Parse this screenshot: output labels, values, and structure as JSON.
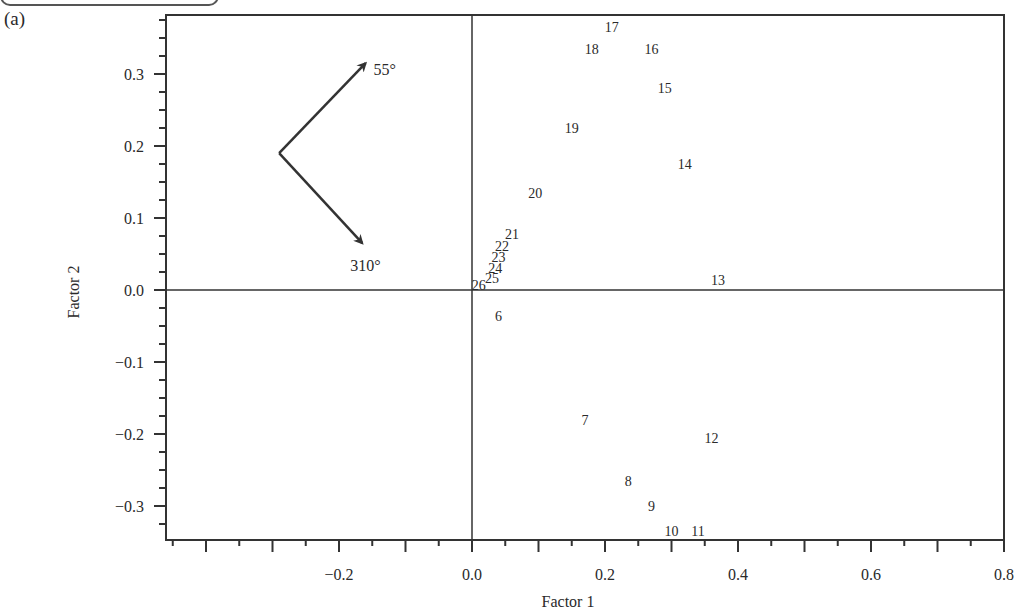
{
  "figure": {
    "panel_label": "(a)"
  },
  "chart_data": {
    "type": "scatter",
    "title": "",
    "panel_label": "(a)",
    "xlabel": "Factor 1",
    "ylabel": "Factor 2",
    "xlim": [
      -0.46,
      0.8
    ],
    "ylim": [
      -0.345,
      0.38
    ],
    "x_ticks": [
      -0.2,
      0.0,
      0.2,
      0.4,
      0.6,
      0.8
    ],
    "x_tick_labels": [
      "−0.2",
      "0.0",
      "0.2",
      "0.4",
      "0.6",
      "0.8"
    ],
    "y_ticks": [
      -0.3,
      -0.2,
      -0.1,
      0.0,
      0.1,
      0.2,
      0.3
    ],
    "y_tick_labels": [
      "−0.3",
      "−0.2",
      "−0.1",
      "0.0",
      "0.1",
      "0.2",
      "0.3"
    ],
    "grid": false,
    "zero_lines": true,
    "marker": "text-label",
    "points": [
      {
        "label": "6",
        "x": 0.04,
        "y": -0.036
      },
      {
        "label": "7",
        "x": 0.17,
        "y": -0.18
      },
      {
        "label": "8",
        "x": 0.235,
        "y": -0.265
      },
      {
        "label": "9",
        "x": 0.27,
        "y": -0.3
      },
      {
        "label": "10",
        "x": 0.3,
        "y": -0.335
      },
      {
        "label": "11",
        "x": 0.34,
        "y": -0.335
      },
      {
        "label": "12",
        "x": 0.36,
        "y": -0.205
      },
      {
        "label": "13",
        "x": 0.37,
        "y": 0.014
      },
      {
        "label": "14",
        "x": 0.32,
        "y": 0.175
      },
      {
        "label": "15",
        "x": 0.29,
        "y": 0.28
      },
      {
        "label": "16",
        "x": 0.27,
        "y": 0.335
      },
      {
        "label": "17",
        "x": 0.21,
        "y": 0.365
      },
      {
        "label": "18",
        "x": 0.18,
        "y": 0.335
      },
      {
        "label": "19",
        "x": 0.15,
        "y": 0.225
      },
      {
        "label": "20",
        "x": 0.095,
        "y": 0.135
      },
      {
        "label": "21",
        "x": 0.06,
        "y": 0.078
      },
      {
        "label": "22",
        "x": 0.045,
        "y": 0.061
      },
      {
        "label": "23",
        "x": 0.04,
        "y": 0.046
      },
      {
        "label": "24",
        "x": 0.035,
        "y": 0.031
      },
      {
        "label": "25",
        "x": 0.03,
        "y": 0.017
      },
      {
        "label": "26",
        "x": 0.01,
        "y": 0.007
      }
    ],
    "annotations": [
      {
        "type": "arrow",
        "label": "55°",
        "from": [
          -0.29,
          0.19
        ],
        "to": [
          -0.16,
          0.315
        ]
      },
      {
        "type": "arrow",
        "label": "310°",
        "from": [
          -0.29,
          0.19
        ],
        "to": [
          -0.165,
          0.065
        ]
      }
    ]
  }
}
